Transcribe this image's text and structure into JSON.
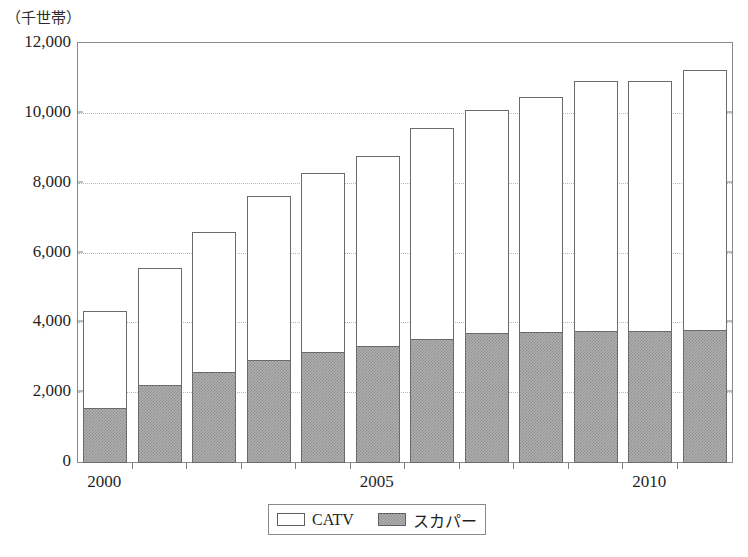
{
  "chart_data": {
    "type": "bar",
    "subtype": "stacked-vertical",
    "title": "",
    "unit_label": "（千世帯）",
    "xlabel": "",
    "ylabel": "",
    "ylim": [
      0,
      12000
    ],
    "ytick_step": 2000,
    "ytick_labels": [
      "0",
      "2,000",
      "4,000",
      "6,000",
      "8,000",
      "10,000",
      "12,000"
    ],
    "ytick_values": [
      0,
      2000,
      4000,
      6000,
      8000,
      10000,
      12000
    ],
    "grid": "horizontal-dotted",
    "legend_position": "bottom-center",
    "categories": [
      "2000",
      "2001",
      "2002",
      "2003",
      "2004",
      "2005",
      "2006",
      "2007",
      "2008",
      "2009",
      "2010",
      "2011"
    ],
    "xtick_labels_shown": [
      "2000",
      "2005",
      "2010"
    ],
    "xtick_label_indices": [
      0,
      5,
      10
    ],
    "series": [
      {
        "name": "スカパー",
        "color": "#b0b0b0",
        "values": [
          1570,
          2230,
          2620,
          2960,
          3170,
          3360,
          3560,
          3720,
          3750,
          3770,
          3780,
          3810
        ]
      },
      {
        "name": "CATV",
        "color": "#ffffff",
        "values": [
          2780,
          3360,
          4000,
          4690,
          5130,
          5430,
          6040,
          6380,
          6730,
          7160,
          7150,
          7440
        ]
      }
    ],
    "totals": [
      4350,
      5590,
      6620,
      7650,
      8300,
      8790,
      9600,
      10100,
      10480,
      10930,
      10930,
      11250
    ]
  },
  "legend": {
    "entries": [
      {
        "label": "CATV",
        "swatch": "white-box"
      },
      {
        "label": "スカパー",
        "swatch": "gray-box"
      }
    ]
  }
}
